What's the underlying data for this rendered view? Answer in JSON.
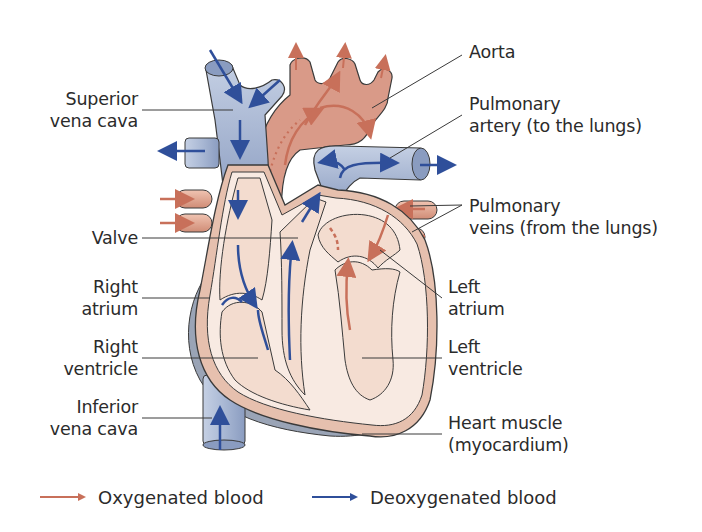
{
  "diagram": {
    "type": "anatomical-diagram",
    "colors": {
      "oxygenated": "#c8705a",
      "deoxygenated": "#2f4f9a",
      "vein_fill": "#a9b8d4",
      "artery_fill": "#d99a88",
      "chamber_fill": "#f3dccf",
      "muscle_fill": "#e6c0ae",
      "outer_shadow": "#9aa4b6"
    }
  },
  "labels": {
    "superior_vena_cava": {
      "line1": "Superior",
      "line2": "vena cava"
    },
    "valve": {
      "line1": "Valve"
    },
    "right_atrium": {
      "line1": "Right",
      "line2": "atrium"
    },
    "right_ventricle": {
      "line1": "Right",
      "line2": "ventricle"
    },
    "inferior_vena_cava": {
      "line1": "Inferior",
      "line2": "vena cava"
    },
    "aorta": {
      "line1": "Aorta"
    },
    "pulmonary_artery": {
      "line1": "Pulmonary",
      "line2": "artery (to the lungs)"
    },
    "pulmonary_veins": {
      "line1": "Pulmonary",
      "line2": "veins (from the lungs)"
    },
    "left_atrium": {
      "line1": "Left",
      "line2": "atrium"
    },
    "left_ventricle": {
      "line1": "Left",
      "line2": "ventricle"
    },
    "heart_muscle": {
      "line1": "Heart muscle",
      "line2": "(myocardium)"
    }
  },
  "legend": [
    {
      "label": "Oxygenated blood",
      "color": "#c8705a"
    },
    {
      "label": "Deoxygenated blood",
      "color": "#2f4f9a"
    }
  ]
}
